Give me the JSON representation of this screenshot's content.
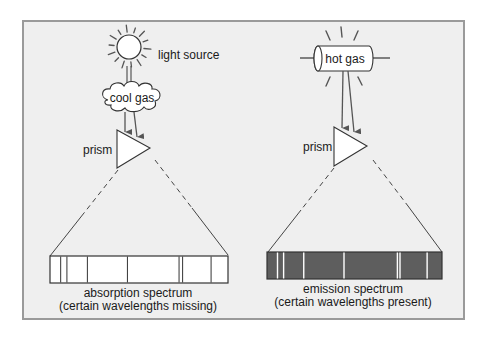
{
  "left_panel": {
    "source_label": "light source",
    "gas_label": "cool gas",
    "prism_label": "prism",
    "spectrum_title": "absorption spectrum",
    "spectrum_caption": "(certain wavelengths missing)",
    "spectrum_type": "absorption",
    "line_positions": [
      0.06,
      0.095,
      0.21,
      0.435,
      0.725,
      0.745,
      0.905
    ],
    "bar_color": "#ffffff",
    "line_color": "#333333"
  },
  "right_panel": {
    "source_label": "hot gas",
    "prism_label": "prism",
    "spectrum_title": "emission spectrum",
    "spectrum_caption": "(certain wavelengths present)",
    "spectrum_type": "emission",
    "line_positions": [
      0.06,
      0.095,
      0.21,
      0.44,
      0.745,
      0.76,
      0.915
    ],
    "bar_color": "#5e5e5e",
    "line_color": "#ffffff"
  },
  "colors": {
    "background": "#efefef",
    "frame": "#9a9a9a",
    "stroke": "#333333",
    "arrow": "#555555"
  }
}
